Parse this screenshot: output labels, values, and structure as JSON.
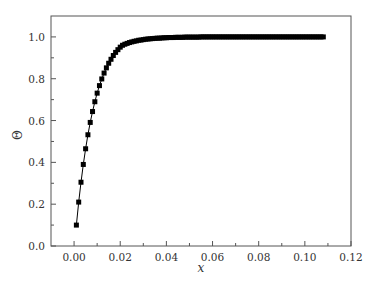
{
  "chart_data": {
    "type": "line",
    "title": "",
    "xlabel": "x",
    "ylabel": "Θ",
    "xlim": [
      -0.01,
      0.12
    ],
    "ylim": [
      0.0,
      1.1
    ],
    "grid": false,
    "legend": null,
    "marker": "square",
    "line_color": "#000000",
    "x_ticks": [
      "0.00",
      "0.02",
      "0.04",
      "0.06",
      "0.08",
      "0.10",
      "0.12"
    ],
    "y_ticks": [
      "0.0",
      "0.2",
      "0.4",
      "0.6",
      "0.8",
      "1.0"
    ],
    "series": [
      {
        "name": "Θ",
        "x": [
          0.001,
          0.002,
          0.003,
          0.004,
          0.005,
          0.006,
          0.007,
          0.008,
          0.009,
          0.01,
          0.011,
          0.012,
          0.013,
          0.014,
          0.015,
          0.016,
          0.017,
          0.018,
          0.019,
          0.02,
          0.021,
          0.022,
          0.023,
          0.024,
          0.025,
          0.026,
          0.027,
          0.028,
          0.029,
          0.03,
          0.031,
          0.032,
          0.033,
          0.034,
          0.035,
          0.036,
          0.037,
          0.038,
          0.039,
          0.04,
          0.041,
          0.042,
          0.043,
          0.044,
          0.045,
          0.046,
          0.047,
          0.048,
          0.049,
          0.05,
          0.051,
          0.052,
          0.053,
          0.054,
          0.055,
          0.056,
          0.057,
          0.058,
          0.059,
          0.06,
          0.061,
          0.062,
          0.063,
          0.064,
          0.065,
          0.066,
          0.067,
          0.068,
          0.069,
          0.07,
          0.071,
          0.072,
          0.073,
          0.074,
          0.075,
          0.076,
          0.077,
          0.078,
          0.079,
          0.08,
          0.081,
          0.082,
          0.083,
          0.084,
          0.085,
          0.086,
          0.087,
          0.088,
          0.089,
          0.09,
          0.091,
          0.092,
          0.093,
          0.094,
          0.095,
          0.096,
          0.097,
          0.098,
          0.099,
          0.1,
          0.101,
          0.102,
          0.103,
          0.104,
          0.105,
          0.106,
          0.107,
          0.108
        ],
        "values": [
          0.1,
          0.21,
          0.305,
          0.39,
          0.465,
          0.532,
          0.591,
          0.643,
          0.69,
          0.731,
          0.767,
          0.799,
          0.827,
          0.852,
          0.874,
          0.893,
          0.911,
          0.926,
          0.939,
          0.951,
          0.96,
          0.965,
          0.969,
          0.973,
          0.976,
          0.979,
          0.981,
          0.984,
          0.985,
          0.987,
          0.989,
          0.99,
          0.991,
          0.992,
          0.993,
          0.994,
          0.994,
          0.995,
          0.996,
          0.996,
          0.997,
          0.997,
          0.997,
          0.998,
          0.998,
          0.998,
          0.998,
          0.999,
          0.999,
          0.999,
          0.999,
          0.999,
          0.999,
          0.999,
          1.0,
          1.0,
          1.0,
          1.0,
          1.0,
          1.0,
          1.0,
          1.0,
          1.0,
          1.0,
          1.0,
          1.0,
          1.0,
          1.0,
          1.0,
          1.0,
          1.0,
          1.0,
          1.0,
          1.0,
          1.0,
          1.0,
          1.0,
          1.0,
          1.0,
          1.0,
          1.0,
          1.0,
          1.0,
          1.0,
          1.0,
          1.0,
          1.0,
          1.0,
          1.0,
          1.0,
          1.0,
          1.0,
          1.0,
          1.0,
          1.0,
          1.0,
          1.0,
          1.0,
          1.0,
          1.0,
          1.0,
          1.0,
          1.0,
          1.0,
          1.0,
          1.0,
          1.0,
          1.0
        ]
      }
    ]
  }
}
